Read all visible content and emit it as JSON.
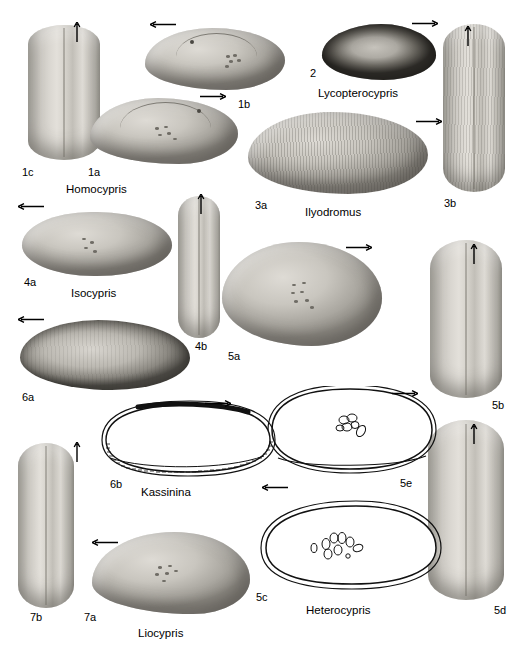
{
  "plate": {
    "title": "Ostracod carapace plate",
    "background_color": "#ffffff",
    "ink_color": "#000000"
  },
  "genus_labels": [
    {
      "name": "Homocypris",
      "x": 66,
      "y": 184
    },
    {
      "name": "Lycopterocypris",
      "x": 318,
      "y": 88
    },
    {
      "name": "Ilyodromus",
      "x": 305,
      "y": 207
    },
    {
      "name": "Isocypris",
      "x": 71,
      "y": 288
    },
    {
      "name": "Kassinina",
      "x": 141,
      "y": 487
    },
    {
      "name": "Heterocypris",
      "x": 306,
      "y": 605
    },
    {
      "name": "Liocypris",
      "x": 138,
      "y": 628
    }
  ],
  "figure_labels": [
    {
      "id": "1c",
      "x": 22,
      "y": 167
    },
    {
      "id": "1a",
      "x": 88,
      "y": 167
    },
    {
      "id": "1b",
      "x": 238,
      "y": 99
    },
    {
      "id": "2",
      "x": 310,
      "y": 68
    },
    {
      "id": "3a",
      "x": 255,
      "y": 200
    },
    {
      "id": "3b",
      "x": 444,
      "y": 198
    },
    {
      "id": "4a",
      "x": 24,
      "y": 277
    },
    {
      "id": "4b",
      "x": 195,
      "y": 341
    },
    {
      "id": "5a",
      "x": 228,
      "y": 351
    },
    {
      "id": "5b",
      "x": 492,
      "y": 400
    },
    {
      "id": "5c",
      "x": 256,
      "y": 592
    },
    {
      "id": "5d",
      "x": 494,
      "y": 605
    },
    {
      "id": "5e",
      "x": 400,
      "y": 478
    },
    {
      "id": "6a",
      "x": 22,
      "y": 392
    },
    {
      "id": "6b",
      "x": 110,
      "y": 479
    },
    {
      "id": "7a",
      "x": 84,
      "y": 612
    },
    {
      "id": "7b",
      "x": 30,
      "y": 612
    }
  ],
  "orientation_arrows": [
    {
      "direction": "up",
      "x": 73,
      "y": 28
    },
    {
      "direction": "left",
      "x": 156,
      "y": 25
    },
    {
      "direction": "right",
      "x": 204,
      "y": 95
    },
    {
      "direction": "right",
      "x": 418,
      "y": 22
    },
    {
      "direction": "up",
      "x": 464,
      "y": 30
    },
    {
      "direction": "right",
      "x": 422,
      "y": 120
    },
    {
      "direction": "left",
      "x": 22,
      "y": 205
    },
    {
      "direction": "up",
      "x": 197,
      "y": 198
    },
    {
      "direction": "right",
      "x": 352,
      "y": 246
    },
    {
      "direction": "up",
      "x": 470,
      "y": 248
    },
    {
      "direction": "left",
      "x": 22,
      "y": 318
    },
    {
      "direction": "right",
      "x": 211,
      "y": 402
    },
    {
      "direction": "right",
      "x": 398,
      "y": 392
    },
    {
      "direction": "up",
      "x": 73,
      "y": 446
    },
    {
      "direction": "up",
      "x": 470,
      "y": 428
    },
    {
      "direction": "left",
      "x": 268,
      "y": 486
    },
    {
      "direction": "left",
      "x": 98,
      "y": 541
    }
  ],
  "specimens": [
    {
      "id": "1c",
      "genus": "Homocypris",
      "view": "dorsal",
      "style": "dorsal"
    },
    {
      "id": "1a",
      "genus": "Homocypris",
      "view": "lateral",
      "style": "lateral"
    },
    {
      "id": "1b",
      "genus": "Homocypris",
      "view": "lateral",
      "style": "lateral"
    },
    {
      "id": "2",
      "genus": "Lycopterocypris",
      "view": "lateral",
      "style": "rough"
    },
    {
      "id": "3a",
      "genus": "Ilyodromus",
      "view": "lateral",
      "style": "striate"
    },
    {
      "id": "3b",
      "genus": "Ilyodromus",
      "view": "dorsal",
      "style": "dorsal"
    },
    {
      "id": "4a",
      "genus": "Isocypris",
      "view": "lateral",
      "style": "lateral"
    },
    {
      "id": "4b",
      "genus": "Isocypris",
      "view": "dorsal",
      "style": "dorsal"
    },
    {
      "id": "5a",
      "genus": "Heterocypris",
      "view": "lateral",
      "style": "lateral"
    },
    {
      "id": "5b",
      "genus": "Heterocypris",
      "view": "dorsal",
      "style": "dorsal"
    },
    {
      "id": "5c",
      "genus": "Heterocypris",
      "view": "outline",
      "style": "outline"
    },
    {
      "id": "5d",
      "genus": "Heterocypris",
      "view": "dorsal",
      "style": "dorsal"
    },
    {
      "id": "5e",
      "genus": "Heterocypris",
      "view": "outline",
      "style": "outline"
    },
    {
      "id": "6a",
      "genus": "Kassinina",
      "view": "lateral",
      "style": "rough"
    },
    {
      "id": "6b",
      "genus": "Kassinina",
      "view": "outline",
      "style": "outline"
    },
    {
      "id": "7a",
      "genus": "Liocypris",
      "view": "lateral",
      "style": "lateral"
    },
    {
      "id": "7b",
      "genus": "Liocypris",
      "view": "dorsal",
      "style": "dorsal"
    }
  ]
}
